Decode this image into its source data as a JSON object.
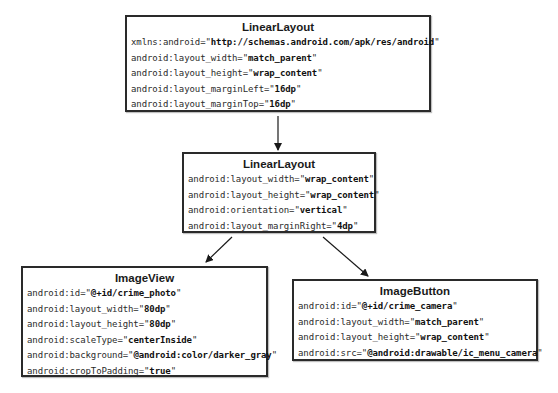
{
  "diagram": {
    "nodes": [
      {
        "id": "root-linear-layout",
        "title": "LinearLayout",
        "attributes": [
          {
            "key": "xmlns:android=",
            "value": "http://schemas.android.com/apk/res/android"
          },
          {
            "key": "android:layout_width=",
            "value": "match_parent"
          },
          {
            "key": "android:layout_height=",
            "value": "wrap_content"
          },
          {
            "key": "android:layout_marginLeft=",
            "value": "16dp"
          },
          {
            "key": "android:layout_marginTop=",
            "value": "16dp"
          }
        ]
      },
      {
        "id": "child-linear-layout",
        "title": "LinearLayout",
        "attributes": [
          {
            "key": "android:layout_width=",
            "value": "wrap_content"
          },
          {
            "key": "android:layout_height=",
            "value": "wrap_content"
          },
          {
            "key": "android:orientation=",
            "value": "vertical"
          },
          {
            "key": "android:layout_marginRight=",
            "value": "4dp"
          }
        ]
      },
      {
        "id": "image-view",
        "title": "ImageView",
        "attributes": [
          {
            "key": "android:id=",
            "value": "@+id/crime_photo"
          },
          {
            "key": "android:layout_width=",
            "value": "80dp"
          },
          {
            "key": "android:layout_height=",
            "value": "80dp"
          },
          {
            "key": "android:scaleType=",
            "value": "centerInside"
          },
          {
            "key": "android:background=",
            "value": "@android:color/darker_gray"
          },
          {
            "key": "android:cropToPadding=",
            "value": "true"
          }
        ]
      },
      {
        "id": "image-button",
        "title": "ImageButton",
        "attributes": [
          {
            "key": "android:id=",
            "value": "@+id/crime_camera"
          },
          {
            "key": "android:layout_width=",
            "value": "match_parent"
          },
          {
            "key": "android:layout_height=",
            "value": "wrap_content"
          },
          {
            "key": "android:src=",
            "value": "@android:drawable/ic_menu_camera"
          }
        ]
      }
    ],
    "edges": [
      {
        "from": "root-linear-layout",
        "to": "child-linear-layout"
      },
      {
        "from": "child-linear-layout",
        "to": "image-view"
      },
      {
        "from": "child-linear-layout",
        "to": "image-button"
      }
    ],
    "colors": {
      "border": "#2a2a2a",
      "text": "#2b2b2b",
      "background": "#ffffff"
    }
  }
}
